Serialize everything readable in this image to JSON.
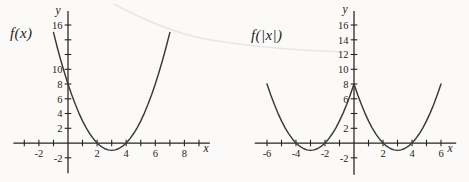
{
  "figure": {
    "background": "#fbfaf8",
    "artifact_color": "#e6e4df"
  },
  "chart_data": [
    {
      "id": "fx",
      "type": "line",
      "label": "f(x)",
      "xlabel": "x",
      "ylabel": "y",
      "xlim": [
        -3.75,
        9.75
      ],
      "ylim": [
        -4.1,
        17.9
      ],
      "curve_color": "#3a3a3a",
      "axis_color": "#242424",
      "x_ticks": [
        {
          "v": -3
        },
        {
          "v": -2,
          "t": "-2"
        },
        {
          "v": -1
        },
        {
          "v": 1
        },
        {
          "v": 2,
          "t": "2"
        },
        {
          "v": 3
        },
        {
          "v": 4,
          "t": "4"
        },
        {
          "v": 5
        },
        {
          "v": 6,
          "t": "6"
        },
        {
          "v": 7
        },
        {
          "v": 8,
          "t": "8"
        },
        {
          "v": 9
        }
      ],
      "y_ticks": [
        {
          "v": -2,
          "t": "-2"
        },
        {
          "v": 2,
          "t": "2"
        },
        {
          "v": 4,
          "t": "4"
        },
        {
          "v": 6,
          "t": "6"
        },
        {
          "v": 8,
          "t": "8"
        },
        {
          "v": 10,
          "t": "10"
        },
        {
          "v": 12
        },
        {
          "v": 14
        },
        {
          "v": 16,
          "t": "16"
        }
      ],
      "points": [
        [
          -1,
          15
        ],
        [
          -0.75,
          13.06
        ],
        [
          -0.5,
          11.25
        ],
        [
          -0.25,
          9.56
        ],
        [
          0,
          8
        ],
        [
          0.25,
          6.56
        ],
        [
          0.5,
          5.25
        ],
        [
          0.75,
          4.06
        ],
        [
          1,
          3
        ],
        [
          1.25,
          2.06
        ],
        [
          1.5,
          1.25
        ],
        [
          1.75,
          0.56
        ],
        [
          2,
          0
        ],
        [
          2.25,
          -0.44
        ],
        [
          2.5,
          -0.75
        ],
        [
          2.75,
          -0.94
        ],
        [
          3,
          -1
        ],
        [
          3.25,
          -0.94
        ],
        [
          3.5,
          -0.75
        ],
        [
          3.75,
          -0.44
        ],
        [
          4,
          0
        ],
        [
          4.25,
          0.56
        ],
        [
          4.5,
          1.25
        ],
        [
          4.75,
          2.06
        ],
        [
          5,
          3
        ],
        [
          5.25,
          4.06
        ],
        [
          5.5,
          5.25
        ],
        [
          5.75,
          6.56
        ],
        [
          6,
          8
        ],
        [
          6.25,
          9.56
        ],
        [
          6.5,
          11.25
        ],
        [
          6.75,
          13.06
        ],
        [
          7,
          15
        ]
      ]
    },
    {
      "id": "fabsx",
      "type": "line",
      "label": "f(|x|)",
      "xlabel": "x",
      "ylabel": "y",
      "xlim": [
        -6.85,
        7.05
      ],
      "ylim": [
        -4.3,
        17.9
      ],
      "curve_color": "#3a3a3a",
      "axis_color": "#242424",
      "x_ticks": [
        {
          "v": -6,
          "t": "-6"
        },
        {
          "v": -5
        },
        {
          "v": -4,
          "t": "-4"
        },
        {
          "v": -3
        },
        {
          "v": -2,
          "t": "-2"
        },
        {
          "v": -1
        },
        {
          "v": 1
        },
        {
          "v": 2,
          "t": "2"
        },
        {
          "v": 3
        },
        {
          "v": 4,
          "t": "4"
        },
        {
          "v": 5
        },
        {
          "v": 6,
          "t": "6"
        }
      ],
      "y_ticks": [
        {
          "v": -2,
          "t": "-2"
        },
        {
          "v": 2,
          "t": "2"
        },
        {
          "v": 4
        },
        {
          "v": 6,
          "t": "6"
        },
        {
          "v": 8,
          "t": "8"
        },
        {
          "v": 10,
          "t": "10"
        },
        {
          "v": 12,
          "t": "12"
        },
        {
          "v": 14,
          "t": "14"
        },
        {
          "v": 16,
          "t": "16"
        }
      ],
      "points": [
        [
          -6,
          8
        ],
        [
          -5.75,
          6.56
        ],
        [
          -5.5,
          5.25
        ],
        [
          -5.25,
          4.06
        ],
        [
          -5,
          3
        ],
        [
          -4.75,
          2.06
        ],
        [
          -4.5,
          1.25
        ],
        [
          -4.25,
          0.56
        ],
        [
          -4,
          0
        ],
        [
          -3.75,
          -0.44
        ],
        [
          -3.5,
          -0.75
        ],
        [
          -3.25,
          -0.94
        ],
        [
          -3,
          -1
        ],
        [
          -2.75,
          -0.94
        ],
        [
          -2.5,
          -0.75
        ],
        [
          -2.25,
          -0.44
        ],
        [
          -2,
          0
        ],
        [
          -1.75,
          0.56
        ],
        [
          -1.5,
          1.25
        ],
        [
          -1.25,
          2.06
        ],
        [
          -1,
          3
        ],
        [
          -0.75,
          4.06
        ],
        [
          -0.5,
          5.25
        ],
        [
          -0.25,
          6.56
        ],
        [
          0,
          8
        ],
        [
          0.25,
          6.56
        ],
        [
          0.5,
          5.25
        ],
        [
          0.75,
          4.06
        ],
        [
          1,
          3
        ],
        [
          1.25,
          2.06
        ],
        [
          1.5,
          1.25
        ],
        [
          1.75,
          0.56
        ],
        [
          2,
          0
        ],
        [
          2.25,
          -0.44
        ],
        [
          2.5,
          -0.75
        ],
        [
          2.75,
          -0.94
        ],
        [
          3,
          -1
        ],
        [
          3.25,
          -0.94
        ],
        [
          3.5,
          -0.75
        ],
        [
          3.75,
          -0.44
        ],
        [
          4,
          0
        ],
        [
          4.25,
          0.56
        ],
        [
          4.5,
          1.25
        ],
        [
          4.75,
          2.06
        ],
        [
          5,
          3
        ],
        [
          5.25,
          4.06
        ],
        [
          5.5,
          5.25
        ],
        [
          5.75,
          6.56
        ],
        [
          6,
          8
        ]
      ]
    }
  ]
}
